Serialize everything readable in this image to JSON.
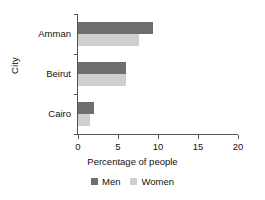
{
  "chart_data": {
    "type": "bar",
    "orientation": "horizontal",
    "title": "",
    "xlabel": "Percentage of people",
    "ylabel": "City",
    "categories": [
      "Amman",
      "Beirut",
      "Cairo"
    ],
    "series": [
      {
        "name": "Men",
        "color": "#6e6e6e",
        "values": [
          9.4,
          6.0,
          2.0
        ]
      },
      {
        "name": "Women",
        "color": "#cfcfcf",
        "values": [
          7.6,
          6.0,
          1.5
        ]
      }
    ],
    "xlim": [
      0,
      20
    ],
    "xticks": [
      0,
      5,
      10,
      15,
      20
    ],
    "xtick_labels": [
      "0",
      "5",
      "10",
      "15",
      "20"
    ],
    "grid": false,
    "legend_position": "bottom"
  },
  "legend": {
    "entries": [
      {
        "label": "Men"
      },
      {
        "label": "Women"
      }
    ]
  }
}
